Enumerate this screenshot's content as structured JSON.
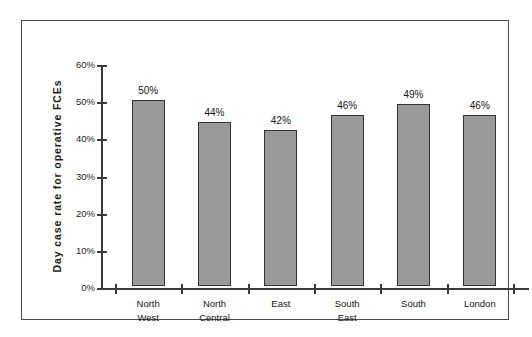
{
  "chart_data": {
    "type": "bar",
    "title": "",
    "xlabel": "",
    "ylabel": "Day case rate  for  operative  FCEs",
    "categories": [
      "North West",
      "North Central",
      "East",
      "South East",
      "South",
      "London"
    ],
    "values": [
      50,
      44,
      42,
      46,
      49,
      46
    ],
    "value_labels": [
      "50%",
      "44%",
      "42%",
      "46%",
      "49%",
      "46%"
    ],
    "ylim": [
      0,
      60
    ],
    "ytick_values": [
      0,
      10,
      20,
      30,
      40,
      50,
      60
    ],
    "ytick_labels": [
      "0%",
      "10%",
      "20%",
      "30%",
      "40%",
      "50%",
      "60%"
    ],
    "grid": false,
    "legend": null,
    "bar_color": "#9a9a9a",
    "bar_border_color": "#333333",
    "axis_color": "#3a3a3a",
    "frame_color": "#4a4a4a",
    "background": "#ffffff"
  },
  "axis": {
    "y_title": "Day case rate  for  operative  FCEs"
  },
  "categories_multiline": [
    "North\nWest",
    "North\nCentral",
    "East",
    "South\nEast",
    "South",
    "London"
  ]
}
